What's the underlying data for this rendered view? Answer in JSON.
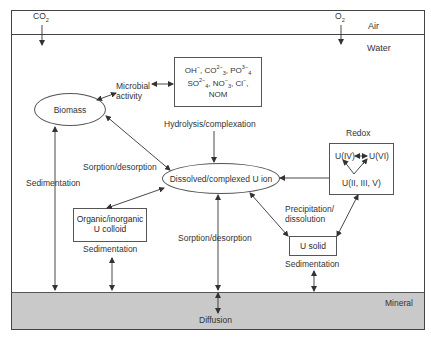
{
  "diagram": {
    "compartments": {
      "air": "Air",
      "water": "Water",
      "mineral": "Mineral"
    },
    "gases": {
      "co2": {
        "base": "CO",
        "sub": "2"
      },
      "o2": {
        "base": "O",
        "sub": "2"
      }
    },
    "nodes": {
      "biomass": "Biomass",
      "dissolved": "Dissolved/complexed U ion",
      "colloid_line1": "Organic/inorganic",
      "colloid_line2": "U colloid",
      "u_solid": "U solid",
      "redox_title": "Redox",
      "redox_u4": "U(IV)",
      "redox_u6": "U(VI)",
      "redox_other": "U(II, III, V)",
      "ligands": {
        "line1": [
          "OH",
          "−",
          ", CO",
          "2−",
          "3",
          ", PO",
          "3−",
          "4"
        ],
        "line2": [
          "SO",
          "2−",
          "4",
          ", NO",
          "−",
          "3",
          ", Cl",
          "−",
          ","
        ],
        "line3": "NOM"
      }
    },
    "process_labels": {
      "microbial_line1": "Microbial",
      "microbial_line2": "activity",
      "hydrolysis": "Hydrolysis/complexation",
      "sorption_upper": "Sorption/desorption",
      "sorption_lower": "Sorption/desorption",
      "sedimentation_left": "Sedimentation",
      "sedimentation_colloid": "Sedimentation",
      "sedimentation_solid": "Sedimentation",
      "precip_line1": "Precipitation/",
      "precip_line2": "dissolution",
      "diffusion": "Diffusion"
    },
    "colors": {
      "line": "#333333",
      "mineral_fill": "#c9c9c9",
      "background": "#ffffff"
    }
  }
}
